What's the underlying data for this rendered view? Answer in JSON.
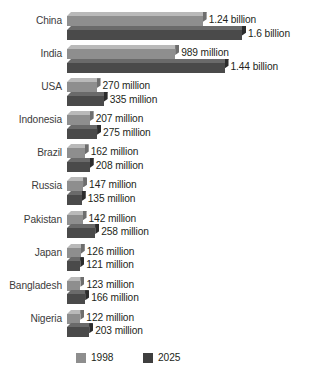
{
  "chart_data": {
    "type": "bar",
    "orientation": "horizontal",
    "title": "",
    "subtitle": "",
    "xlabel": "",
    "ylabel": "",
    "grid": false,
    "legend_position": "bottom",
    "axis_range_millions": [
      0,
      1600
    ],
    "categories": [
      "China",
      "India",
      "USA",
      "Indonesia",
      "Brazil",
      "Russia",
      "Pakistan",
      "Japan",
      "Bangladesh",
      "Nigeria"
    ],
    "series": [
      {
        "name": "1998",
        "color": "#8e8e8e",
        "values": [
          1240,
          989,
          270,
          207,
          162,
          147,
          142,
          126,
          123,
          122
        ],
        "labels": [
          "1.24 billion",
          "989 million",
          "270 million",
          "207 million",
          "162 million",
          "147 million",
          "142 million",
          "126 million",
          "123 million",
          "122 million"
        ]
      },
      {
        "name": "2025",
        "color": "#3f3f3f",
        "values": [
          1600,
          1440,
          335,
          275,
          208,
          135,
          258,
          121,
          166,
          203
        ],
        "labels": [
          "1.6 billion",
          "1.44 billion",
          "335 million",
          "275 million",
          "208 million",
          "135 million",
          "258 million",
          "121 million",
          "166 million",
          "203 million"
        ]
      }
    ]
  },
  "legend": {
    "items": [
      {
        "label": "1998",
        "color": "#8e8e8e"
      },
      {
        "label": "2025",
        "color": "#3f3f3f"
      }
    ]
  }
}
